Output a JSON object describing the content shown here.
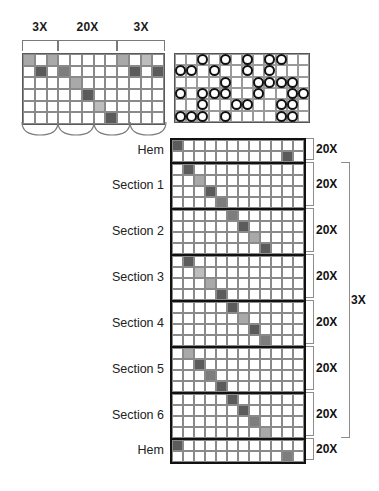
{
  "swatch": {
    "title": "repeat-swatch",
    "columns": 12,
    "rows": 6,
    "top_brackets": [
      {
        "label": "3X",
        "start_col": 1,
        "span": 3
      },
      {
        "label": "20X",
        "start_col": 4,
        "span": 5
      },
      {
        "label": "3X",
        "start_col": 9,
        "span": 4
      }
    ],
    "cells": [
      [
        "light",
        "white",
        "light",
        "white",
        "white",
        "white",
        "white",
        "white",
        "light",
        "white",
        "pale",
        "white"
      ],
      [
        "white",
        "dark",
        "white",
        "mid",
        "white",
        "white",
        "white",
        "white",
        "white",
        "dark",
        "white",
        "dark"
      ],
      [
        "white",
        "white",
        "white",
        "white",
        "light",
        "white",
        "white",
        "white",
        "white",
        "white",
        "white",
        "white"
      ],
      [
        "white",
        "white",
        "white",
        "white",
        "white",
        "dark",
        "white",
        "white",
        "white",
        "white",
        "white",
        "white"
      ],
      [
        "white",
        "white",
        "white",
        "white",
        "white",
        "white",
        "pale",
        "white",
        "white",
        "white",
        "white",
        "white"
      ],
      [
        "white",
        "white",
        "white",
        "white",
        "white",
        "white",
        "white",
        "dark",
        "white",
        "white",
        "white",
        "white"
      ]
    ]
  },
  "circle_panel": {
    "title": "circle-chart",
    "columns": 12,
    "rows": 6,
    "cells": [
      [
        0,
        0,
        1,
        0,
        1,
        0,
        1,
        0,
        1,
        1,
        0,
        0
      ],
      [
        1,
        1,
        0,
        1,
        0,
        0,
        1,
        0,
        1,
        0,
        0,
        0
      ],
      [
        0,
        0,
        0,
        0,
        1,
        0,
        0,
        1,
        1,
        1,
        1,
        0
      ],
      [
        1,
        0,
        1,
        1,
        1,
        0,
        0,
        1,
        0,
        0,
        1,
        1
      ],
      [
        0,
        0,
        1,
        0,
        0,
        1,
        1,
        0,
        0,
        1,
        1,
        0
      ],
      [
        1,
        1,
        1,
        0,
        1,
        0,
        0,
        0,
        0,
        1,
        1,
        0
      ]
    ]
  },
  "main_chart": {
    "columns": 12,
    "outer_bracket_label": "3X",
    "bands": [
      {
        "label": "Hem",
        "repeat": "20X",
        "rows": [
          [
            "dark",
            "white",
            "white",
            "white",
            "white",
            "white",
            "white",
            "white",
            "white",
            "white",
            "white",
            "white"
          ],
          [
            "white",
            "white",
            "white",
            "white",
            "white",
            "white",
            "white",
            "white",
            "white",
            "white",
            "dark",
            "white"
          ]
        ]
      },
      {
        "label": "Section 1",
        "repeat": "20X",
        "rows": [
          [
            "white",
            "dark",
            "white",
            "white",
            "white",
            "white",
            "white",
            "white",
            "white",
            "white",
            "white",
            "white"
          ],
          [
            "white",
            "white",
            "light",
            "white",
            "white",
            "white",
            "white",
            "white",
            "white",
            "white",
            "white",
            "white"
          ],
          [
            "white",
            "white",
            "white",
            "dark",
            "white",
            "white",
            "white",
            "white",
            "white",
            "white",
            "white",
            "white"
          ],
          [
            "white",
            "white",
            "white",
            "white",
            "mid",
            "white",
            "white",
            "white",
            "white",
            "white",
            "white",
            "white"
          ]
        ]
      },
      {
        "label": "Section 2",
        "repeat": "20X",
        "rows": [
          [
            "white",
            "white",
            "white",
            "white",
            "white",
            "mid",
            "white",
            "white",
            "white",
            "white",
            "white",
            "white"
          ],
          [
            "white",
            "white",
            "white",
            "white",
            "white",
            "white",
            "dark",
            "white",
            "white",
            "white",
            "white",
            "white"
          ],
          [
            "white",
            "white",
            "white",
            "white",
            "white",
            "white",
            "white",
            "light",
            "white",
            "white",
            "white",
            "white"
          ],
          [
            "white",
            "white",
            "white",
            "white",
            "white",
            "white",
            "white",
            "white",
            "dark",
            "white",
            "white",
            "white"
          ]
        ]
      },
      {
        "label": "Section 3",
        "repeat": "20X",
        "rows": [
          [
            "white",
            "dark",
            "white",
            "white",
            "white",
            "white",
            "white",
            "white",
            "white",
            "white",
            "white",
            "white"
          ],
          [
            "white",
            "white",
            "pale",
            "white",
            "white",
            "white",
            "white",
            "white",
            "white",
            "white",
            "white",
            "white"
          ],
          [
            "white",
            "white",
            "white",
            "light",
            "white",
            "white",
            "white",
            "white",
            "white",
            "white",
            "white",
            "white"
          ],
          [
            "white",
            "white",
            "white",
            "white",
            "dark",
            "white",
            "white",
            "white",
            "white",
            "white",
            "white",
            "white"
          ]
        ]
      },
      {
        "label": "Section 4",
        "repeat": "20X",
        "rows": [
          [
            "white",
            "white",
            "white",
            "white",
            "white",
            "dark",
            "white",
            "white",
            "white",
            "white",
            "white",
            "white"
          ],
          [
            "white",
            "white",
            "white",
            "white",
            "white",
            "white",
            "light",
            "white",
            "white",
            "white",
            "white",
            "white"
          ],
          [
            "white",
            "white",
            "white",
            "white",
            "white",
            "white",
            "white",
            "dark",
            "white",
            "white",
            "white",
            "white"
          ],
          [
            "white",
            "white",
            "white",
            "white",
            "white",
            "white",
            "white",
            "white",
            "mid",
            "white",
            "white",
            "white"
          ]
        ]
      },
      {
        "label": "Section 5",
        "repeat": "20X",
        "rows": [
          [
            "white",
            "light",
            "white",
            "white",
            "white",
            "white",
            "white",
            "white",
            "white",
            "white",
            "white",
            "white"
          ],
          [
            "white",
            "white",
            "dark",
            "white",
            "white",
            "white",
            "white",
            "white",
            "white",
            "white",
            "white",
            "white"
          ],
          [
            "white",
            "white",
            "white",
            "mid",
            "white",
            "white",
            "white",
            "white",
            "white",
            "white",
            "white",
            "white"
          ],
          [
            "white",
            "white",
            "white",
            "white",
            "dark",
            "white",
            "white",
            "white",
            "white",
            "white",
            "white",
            "white"
          ]
        ]
      },
      {
        "label": "Section 6",
        "repeat": "20X",
        "rows": [
          [
            "white",
            "white",
            "white",
            "white",
            "white",
            "dark",
            "white",
            "white",
            "white",
            "white",
            "white",
            "white"
          ],
          [
            "white",
            "white",
            "white",
            "white",
            "white",
            "white",
            "dark",
            "white",
            "white",
            "white",
            "white",
            "white"
          ],
          [
            "white",
            "white",
            "white",
            "white",
            "white",
            "white",
            "white",
            "mid",
            "white",
            "white",
            "white",
            "white"
          ],
          [
            "white",
            "white",
            "white",
            "white",
            "white",
            "white",
            "white",
            "white",
            "light",
            "white",
            "white",
            "white"
          ]
        ]
      },
      {
        "label": "Hem",
        "repeat": "20X",
        "rows": [
          [
            "dark",
            "white",
            "white",
            "white",
            "white",
            "white",
            "white",
            "white",
            "white",
            "white",
            "white",
            "white"
          ],
          [
            "white",
            "white",
            "white",
            "white",
            "white",
            "white",
            "white",
            "white",
            "white",
            "white",
            "mid",
            "white"
          ]
        ]
      }
    ]
  },
  "colors": {
    "dark": "#5b5b5b",
    "mid": "#7d7d7d",
    "light": "#a9a9a9",
    "pale": "#bdbdbd",
    "white": "#ffffff",
    "line": "#111111"
  }
}
